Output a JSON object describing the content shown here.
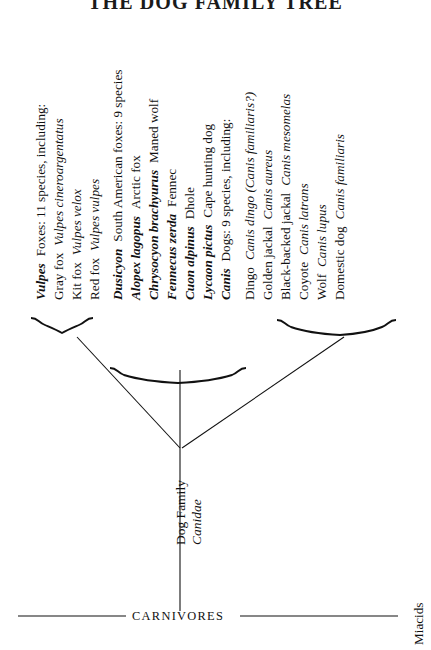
{
  "title": "THE DOG FAMILY TREE",
  "diagram": {
    "type": "phylogenetic-tree",
    "orientation": "rotated-90-ccw",
    "root_label_line1": "Dog Family",
    "root_label_line2": "Canidae",
    "baseline_label": "CARNIVORES",
    "outgroup_label": "Miacids",
    "groups": [
      {
        "id": "vulpes-group",
        "bracket": "left",
        "rows": [
          {
            "genus": "Vulpes",
            "text": "Foxes: 11 species, including:",
            "style": "genus-heading"
          },
          {
            "common": "Gray fox",
            "species": "Vulpes cineroargentatus",
            "style": "species"
          },
          {
            "common": "Kit fox",
            "species": "Vulpes velox",
            "style": "species"
          },
          {
            "common": "Red fox",
            "species": "Vulpes vulpes",
            "style": "species"
          }
        ]
      },
      {
        "id": "middle-group",
        "bracket": "center",
        "rows": [
          {
            "genus": "Dusicyon",
            "text": "South American foxes: 9 species",
            "style": "genus-heading"
          },
          {
            "genus": "Alopex lagopus",
            "text": "Arctic fox",
            "style": "genus-species"
          },
          {
            "genus": "Chrysocyon brachyurus",
            "text": "Maned wolf",
            "style": "genus-species"
          },
          {
            "genus": "Fennecus zerda",
            "text": "Fennec",
            "style": "genus-species"
          },
          {
            "genus": "Cuon alpinus",
            "text": "Dhole",
            "style": "genus-species"
          },
          {
            "genus": "Lycaon pictus",
            "text": "Cape hunting dog",
            "style": "genus-species"
          },
          {
            "genus": "Canis",
            "text": "Dogs: 9 species, including:",
            "style": "genus-heading"
          }
        ]
      },
      {
        "id": "canis-group",
        "bracket": "right",
        "rows": [
          {
            "common": "Dingo",
            "species": "Canis dingo (Canis familiaris?)",
            "style": "species"
          },
          {
            "common": "Golden jackal",
            "species": "Canis aureus",
            "style": "species"
          },
          {
            "common": "Black-backed jackal",
            "species": "Canis mesomelas",
            "style": "species"
          },
          {
            "common": "Coyote",
            "species": "Canis latrans",
            "style": "species"
          },
          {
            "common": "Wolf",
            "species": "Canis lupus",
            "style": "species"
          },
          {
            "common": "Domestic dog",
            "species": "Canis familiaris",
            "style": "species"
          }
        ]
      }
    ]
  },
  "rows_flat": [
    {
      "a": "Vulpes",
      "b": "Foxes: 11 species, including:"
    },
    {
      "a": "Gray fox",
      "b": "Vulpes cineroargentatus"
    },
    {
      "a": "Kit fox",
      "b": "Vulpes velox"
    },
    {
      "a": "Red fox",
      "b": "Vulpes vulpes"
    },
    {
      "a": "Dusicyon",
      "b": "South American foxes: 9 species"
    },
    {
      "a": "Alopex lagopus",
      "b": "Arctic fox"
    },
    {
      "a": "Chrysocyon brachyurus",
      "b": "Maned wolf"
    },
    {
      "a": "Fennecus zerda",
      "b": "Fennec"
    },
    {
      "a": "Cuon alpinus",
      "b": "Dhole"
    },
    {
      "a": "Lycaon pictus",
      "b": "Cape hunting dog"
    },
    {
      "a": "Canis",
      "b": "Dogs: 9 species, including:"
    },
    {
      "a": "Dingo",
      "b": "Canis dingo (Canis familiaris?)"
    },
    {
      "a": "Golden jackal",
      "b": "Canis aureus"
    },
    {
      "a": "Black-backed jackal",
      "b": "Canis mesomelas"
    },
    {
      "a": "Coyote",
      "b": "Canis latrans"
    },
    {
      "a": "Wolf",
      "b": "Canis lupus"
    },
    {
      "a": "Domestic dog",
      "b": "Canis familiaris"
    }
  ],
  "colors": {
    "ink": "#111111",
    "paper": "#ffffff"
  }
}
